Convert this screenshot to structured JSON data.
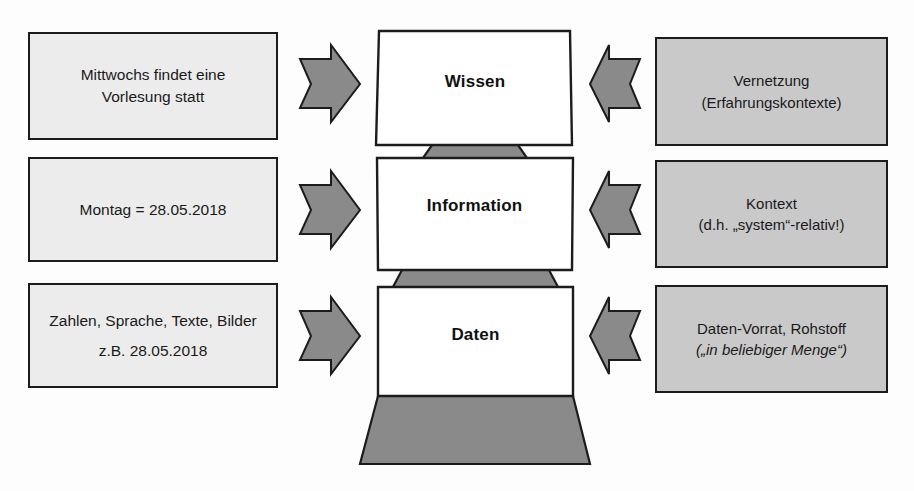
{
  "diagram": {
    "colors": {
      "left_box_fill": "#ececec",
      "right_box_fill": "#c9c9c9",
      "tier_fill": "#ffffff",
      "connector_fill": "#8a8a8a",
      "base_fill": "#8a8a8a",
      "arrow_fill": "#8a8a8a",
      "stroke": "#1c1c1c"
    },
    "left_boxes": [
      {
        "id": "left-wissen",
        "lines": [
          "Mittwochs findet eine",
          "Vorlesung statt"
        ],
        "italic": [
          false,
          false
        ]
      },
      {
        "id": "left-information",
        "lines": [
          "Montag = 28.05.2018"
        ],
        "italic": [
          false
        ]
      },
      {
        "id": "left-daten",
        "lines": [
          "Zahlen, Sprache, Texte, Bilder",
          "z.B. 28.05.2018"
        ],
        "italic": [
          false,
          false
        ]
      }
    ],
    "right_boxes": [
      {
        "id": "right-wissen",
        "lines": [
          "Vernetzung",
          "(Erfahrungskontexte)"
        ],
        "italic": [
          false,
          false
        ]
      },
      {
        "id": "right-information",
        "lines": [
          "Kontext",
          "(d.h. „system“-relativ!)"
        ],
        "italic": [
          false,
          false
        ]
      },
      {
        "id": "right-daten",
        "lines": [
          "Daten-Vorrat, Rohstoff",
          "(„in beliebiger Menge“)"
        ],
        "italic": [
          false,
          true
        ]
      }
    ],
    "pyramid_tiers": [
      {
        "id": "tier-wissen",
        "label": "Wissen"
      },
      {
        "id": "tier-information",
        "label": "Information"
      },
      {
        "id": "tier-daten",
        "label": "Daten"
      }
    ],
    "arrows_left": [
      {
        "id": "arrow-left-1",
        "direction": "right"
      },
      {
        "id": "arrow-left-2",
        "direction": "right"
      },
      {
        "id": "arrow-left-3",
        "direction": "right"
      }
    ],
    "arrows_right": [
      {
        "id": "arrow-right-1",
        "direction": "left"
      },
      {
        "id": "arrow-right-2",
        "direction": "left"
      },
      {
        "id": "arrow-right-3",
        "direction": "left"
      }
    ]
  }
}
